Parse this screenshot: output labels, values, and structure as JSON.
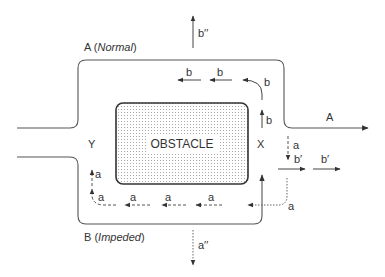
{
  "diagram": {
    "obstacle": {
      "label": "OBSTACLE"
    },
    "routes": {
      "top": {
        "letter": "A",
        "qualifier": "Normal",
        "open": " (",
        "close": ")"
      },
      "bottom": {
        "letter": "B",
        "qualifier": "Impeded",
        "open": " (",
        "close": ")"
      },
      "exit_label": "A"
    },
    "nodes": {
      "left": "Y",
      "right": "X"
    },
    "flow_labels": {
      "b": "b",
      "b_prime": "b′",
      "b_double_prime": "b′′",
      "a": "a",
      "a_double_prime": "a′′"
    },
    "colors": {
      "line": "#555555",
      "text": "#333333",
      "obstacle_fill": "#f4f4f4",
      "obstacle_dots": "#9a9a9a"
    }
  }
}
